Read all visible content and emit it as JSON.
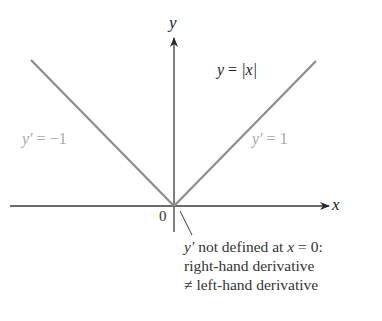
{
  "figure": {
    "function_label": {
      "lhs": "y",
      "eq": " = ",
      "rhs": "|x|"
    },
    "axes": {
      "x_label": "x",
      "y_label": "y",
      "origin_label": "0"
    },
    "left_branch": {
      "slope_label_var": "y′",
      "slope_label_eq": " = −1",
      "slope": -1
    },
    "right_branch": {
      "slope_label_var": "y′",
      "slope_label_eq": " = 1",
      "slope": 1
    },
    "annotation": {
      "line1_var": "y′",
      "line1_text": " not defined at ",
      "line1_x": "x",
      "line1_tail": " = 0:",
      "line2": "right-hand derivative",
      "line3": "≠ left-hand derivative"
    },
    "colors": {
      "axes": "#3a3a3a",
      "graph": "#8c8c8c",
      "slope_labels": "#a8a8a8",
      "text": "#2b2b2b"
    }
  }
}
